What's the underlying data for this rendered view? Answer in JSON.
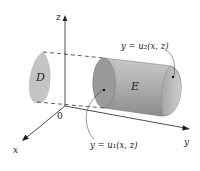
{
  "diagram": {
    "type": "3d-region-illustration",
    "axes": {
      "x_label": "x",
      "y_label": "y",
      "z_label": "z",
      "origin_label": "0"
    },
    "regions": {
      "projection_label": "D",
      "solid_label": "E"
    },
    "surfaces": {
      "back_surface": "y = u₂(x, z)",
      "front_surface": "y = u₁(x, z)"
    },
    "colors": {
      "solid_fill": "#a9a9a9",
      "projection_fill": "#c4c4c4",
      "axis_color": "#222222",
      "dash_color": "#333333"
    }
  }
}
